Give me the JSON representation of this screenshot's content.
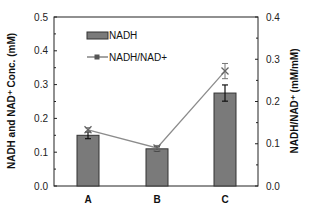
{
  "chart_data": {
    "type": "bar",
    "categories": [
      "A",
      "B",
      "C"
    ],
    "series": [
      {
        "name": "NADH",
        "type": "bar",
        "axis": "left",
        "values": [
          0.15,
          0.11,
          0.275
        ],
        "errors": [
          0.01,
          0.006,
          0.024
        ],
        "color": "#7a7a7a"
      },
      {
        "name": "NADH/NAD+",
        "type": "line",
        "axis": "right",
        "values": [
          0.133,
          0.09,
          0.272
        ],
        "errors": [
          0.005,
          0.006,
          0.018
        ],
        "color": "#8c8c8c"
      }
    ],
    "ylabel": "NADH and NAD⁺ Conc. (mM)",
    "y2label": "NADH/NAD⁺ (mM/mM)",
    "xlabel": "",
    "ylim": [
      0.0,
      0.5
    ],
    "y2lim": [
      0.0,
      0.4
    ],
    "yticks": [
      "0.0",
      "0.1",
      "0.2",
      "0.3",
      "0.4",
      "0.5"
    ],
    "y2ticks": [
      "0.0",
      "0.1",
      "0.2",
      "0.3",
      "0.4"
    ],
    "legend": {
      "position": "upper-left",
      "entries": [
        "NADH",
        "NADH/NAD+"
      ]
    },
    "grid": false
  }
}
